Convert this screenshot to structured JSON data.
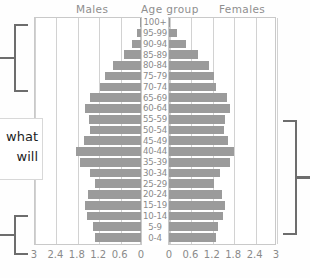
{
  "header": {
    "males_label": "Males",
    "age_label": "Age group",
    "females_label": "Females"
  },
  "note": {
    "line1": "what",
    "line2": "will"
  },
  "axis": {
    "left_ticks": [
      "3",
      "2.4",
      "1.8",
      "1.2",
      "0.6",
      "0"
    ],
    "right_ticks": [
      "0",
      "0.6",
      "1.2",
      "1.8",
      "2.4",
      "3"
    ]
  },
  "chart_data": {
    "type": "bar",
    "title": "",
    "subtype": "population-pyramid",
    "xlabel": "",
    "ylabel": "Age group",
    "xlim": [
      0,
      3
    ],
    "grid": true,
    "legend_position": "top",
    "categories": [
      "100+",
      "95-99",
      "90-94",
      "85-89",
      "80-84",
      "75-79",
      "70-74",
      "65-69",
      "60-64",
      "55-59",
      "50-54",
      "45-49",
      "40-44",
      "35-39",
      "30-34",
      "25-29",
      "20-24",
      "15-19",
      "10-14",
      "5-9",
      "0-4"
    ],
    "series": [
      {
        "name": "Males",
        "side": "left",
        "values": [
          0.02,
          0.1,
          0.25,
          0.48,
          0.78,
          1.02,
          1.16,
          1.42,
          1.56,
          1.46,
          1.44,
          1.6,
          1.82,
          1.72,
          1.44,
          1.28,
          1.5,
          1.58,
          1.52,
          1.36,
          1.3
        ]
      },
      {
        "name": "Females",
        "side": "right",
        "values": [
          0.04,
          0.22,
          0.48,
          0.8,
          1.12,
          1.26,
          1.32,
          1.62,
          1.72,
          1.58,
          1.54,
          1.66,
          1.82,
          1.7,
          1.42,
          1.26,
          1.48,
          1.56,
          1.5,
          1.38,
          1.32
        ]
      }
    ]
  }
}
